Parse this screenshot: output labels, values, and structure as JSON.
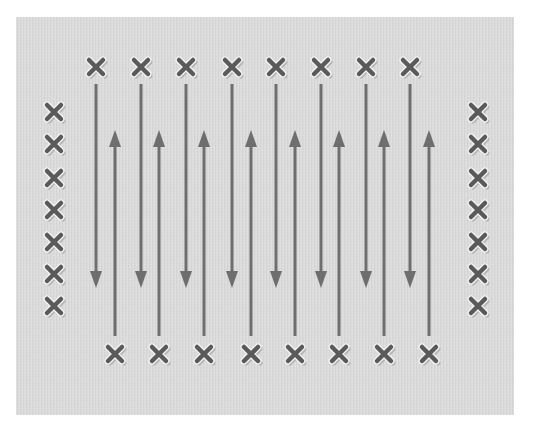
{
  "diagram": {
    "type": "serpentine-scan-pattern",
    "colors": {
      "background": "#ffffff",
      "panel": "#dadada",
      "arrow": "#6e6e6e",
      "marker": "#5a5a5a",
      "marker_halo": "#f4f4f4",
      "marker_shadow": "#b5b5b5"
    },
    "panel": {
      "x": 16,
      "y": 17,
      "width": 498,
      "height": 398
    },
    "markers": {
      "top_row": {
        "y": 67,
        "x": [
          96,
          141,
          186,
          232,
          276,
          321,
          366,
          410
        ]
      },
      "bottom_row": {
        "y": 354,
        "x": [
          115,
          159,
          204,
          251,
          295,
          339,
          384,
          429
        ]
      },
      "left_column": {
        "x": 54,
        "y": [
          112,
          144,
          178,
          210,
          242,
          274,
          306
        ]
      },
      "right_column": {
        "x": 478,
        "y": [
          112,
          144,
          178,
          210,
          242,
          274,
          306
        ]
      }
    },
    "arrows": {
      "down": {
        "x": [
          96,
          141,
          186,
          232,
          276,
          321,
          366,
          410
        ],
        "y_start": 84,
        "y_end": 288
      },
      "up": {
        "x": [
          115,
          159,
          204,
          251,
          295,
          339,
          384,
          429
        ],
        "y_start": 336,
        "y_end": 130
      }
    }
  }
}
